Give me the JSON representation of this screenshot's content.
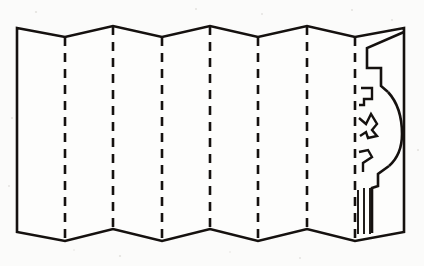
{
  "figure": {
    "title": "Accordion-folded paper strip with cutting pattern",
    "ink_color": "#15110f",
    "paper_color": "#fdfdfc",
    "background_color": "#fbfbfa"
  },
  "geometry": {
    "canvas_width": 424,
    "canvas_height": 266,
    "left_edge_x": 17,
    "right_edge_x": 404,
    "panel_count": 8,
    "fold_count": 7,
    "fold_x_positions": [
      65,
      113,
      162,
      210,
      258,
      307,
      355
    ],
    "top_peak_y": 26,
    "top_valley_y": 37,
    "bottom_peak_y": 229,
    "bottom_valley_y": 241,
    "zigzag_description": "Top edge rises to a peak at every second crease and dips to a valley between; the bottom edge mirrors it.",
    "left_edge_top_y": 28,
    "left_edge_bottom_y": 232,
    "right_edge_top_y": 28,
    "right_edge_bottom_y": 232
  },
  "fold_lines": [
    {
      "id": "fold-1",
      "x": 65,
      "style": "dashed",
      "label": "crease 1",
      "vertex": "valley"
    },
    {
      "id": "fold-2",
      "x": 113,
      "style": "dashed",
      "label": "crease 2",
      "vertex": "peak"
    },
    {
      "id": "fold-3",
      "x": 162,
      "style": "dashed",
      "label": "crease 3",
      "vertex": "valley"
    },
    {
      "id": "fold-4",
      "x": 210,
      "style": "dashed",
      "label": "crease 4",
      "vertex": "peak"
    },
    {
      "id": "fold-5",
      "x": 258,
      "style": "dashed",
      "label": "crease 5",
      "vertex": "valley"
    },
    {
      "id": "fold-6",
      "x": 307,
      "style": "dashed",
      "label": "crease 6",
      "vertex": "peak"
    },
    {
      "id": "fold-7",
      "x": 355,
      "style": "dashed",
      "label": "crease 7",
      "vertex": "valley"
    }
  ],
  "cut_pattern": {
    "panel": "rightmost",
    "panel_left_x": 355,
    "panel_right_x": 404,
    "elements": [
      {
        "id": "upper-step-notch",
        "type": "stepped-rectangular-notch",
        "position": "upper",
        "description": "Angled band from the top edge stepping down in two right-angle steps."
      },
      {
        "id": "bulge-curve",
        "type": "convex-arc",
        "position": "middle",
        "description": "Large rounded bulge swelling outward toward the right edge."
      },
      {
        "id": "lower-step-notch",
        "type": "stepped-rectangular-notch",
        "position": "lower",
        "description": "Two right-angle steps descending to the bottom edge."
      },
      {
        "id": "motif-hook-upper",
        "type": "hook-zigzag",
        "position": "upper-inner",
        "description": "Small squared hook motif beside the crease."
      },
      {
        "id": "motif-star-middle",
        "type": "angular-zigzag",
        "position": "middle-inner",
        "description": "Pointed zigzag / star-like angular motif."
      },
      {
        "id": "motif-hook-lower",
        "type": "hook-zigzag",
        "position": "lower-inner",
        "description": "Small squared hook motif lower down."
      }
    ],
    "hatch_strokes": {
      "count": 3,
      "x_positions": [
        358,
        364,
        371
      ],
      "top_y": 188,
      "bottom_y": 233,
      "description": "Three short parallel vertical strokes near the bottom of the last panel."
    }
  }
}
